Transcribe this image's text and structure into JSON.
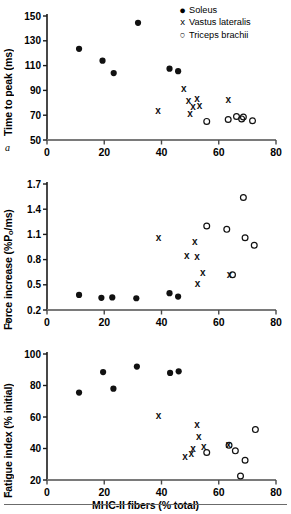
{
  "figure": {
    "xlabel": "MHC-II fibers (% total)",
    "legend": [
      {
        "marker": "filled-circle",
        "symbol": "●",
        "label": "Soleus"
      },
      {
        "marker": "x-cross",
        "symbol": "x",
        "label": "Vastus lateralis"
      },
      {
        "marker": "open-circle",
        "symbol": "○",
        "label": "Triceps brachii"
      }
    ],
    "panel_letters": {
      "a": "a",
      "b": "b",
      "c": "c"
    }
  },
  "chart_data": [
    {
      "type": "scatter",
      "panel": "a",
      "title": "",
      "xlabel": "MHC-II fibers (% total)",
      "ylabel": "Time to peak (ms)",
      "xlim": [
        0,
        80
      ],
      "ylim": [
        50,
        150
      ],
      "xticks": [
        0,
        20,
        40,
        60,
        80
      ],
      "yticks": [
        50,
        70,
        90,
        110,
        130,
        150
      ],
      "grid": false,
      "legend_position": "top-right",
      "series": [
        {
          "name": "Soleus",
          "marker": "filled-circle",
          "points": [
            [
              11.2,
              123.5
            ],
            [
              19.4,
              114.0
            ],
            [
              23.3,
              104.0
            ],
            [
              31.8,
              144.5
            ],
            [
              42.8,
              107.5
            ],
            [
              45.8,
              105.5
            ]
          ]
        },
        {
          "name": "Vastus lateralis",
          "marker": "x-cross",
          "points": [
            [
              38.8,
              74.0
            ],
            [
              47.8,
              91.5
            ],
            [
              49.4,
              81.5
            ],
            [
              51.0,
              77.0
            ],
            [
              50.0,
              71.5
            ],
            [
              52.4,
              83.0
            ],
            [
              53.3,
              77.5
            ],
            [
              63.3,
              82.5
            ]
          ]
        },
        {
          "name": "Triceps brachii",
          "marker": "open-circle",
          "points": [
            [
              55.8,
              65.0
            ],
            [
              63.3,
              66.5
            ],
            [
              66.2,
              69.0
            ],
            [
              68.0,
              67.0
            ],
            [
              68.6,
              68.5
            ],
            [
              71.8,
              65.5
            ]
          ]
        }
      ]
    },
    {
      "type": "scatter",
      "panel": "b",
      "title": "",
      "xlabel": "MHC-II fibers (% total)",
      "ylabel": "Force increase (%Po/ms)",
      "ylabel_parts": {
        "pre": "Force increase (%P",
        "sub": "o",
        "post": "/ms)"
      },
      "xlim": [
        0,
        80
      ],
      "ylim": [
        0.2,
        1.7
      ],
      "xticks": [
        0,
        20,
        40,
        60,
        80
      ],
      "yticks": [
        0.2,
        0.5,
        0.8,
        1.1,
        1.4,
        1.7
      ],
      "grid": false,
      "legend_position": "none",
      "series": [
        {
          "name": "Soleus",
          "marker": "filled-circle",
          "points": [
            [
              11.2,
              0.38
            ],
            [
              19.0,
              0.345
            ],
            [
              22.8,
              0.35
            ],
            [
              31.2,
              0.34
            ],
            [
              42.8,
              0.4
            ],
            [
              45.8,
              0.36
            ]
          ]
        },
        {
          "name": "Vastus lateralis",
          "marker": "x-cross",
          "points": [
            [
              39.0,
              1.06
            ],
            [
              48.8,
              0.85
            ],
            [
              51.6,
              1.02
            ],
            [
              52.4,
              0.83
            ],
            [
              52.6,
              0.51
            ],
            [
              54.4,
              0.64
            ],
            [
              63.8,
              0.62
            ]
          ]
        },
        {
          "name": "Triceps brachii",
          "marker": "open-circle",
          "points": [
            [
              55.8,
              1.2
            ],
            [
              62.8,
              1.16
            ],
            [
              64.8,
              0.62
            ],
            [
              68.6,
              1.54
            ],
            [
              69.2,
              1.06
            ],
            [
              72.4,
              0.97
            ]
          ]
        }
      ]
    },
    {
      "type": "scatter",
      "panel": "c",
      "title": "",
      "xlabel": "MHC-II fibers (% total)",
      "ylabel": "Fatigue index (% initial)",
      "xlim": [
        0,
        80
      ],
      "ylim": [
        20,
        100
      ],
      "xticks": [
        0,
        20,
        40,
        60,
        80
      ],
      "yticks": [
        20,
        40,
        60,
        80,
        100
      ],
      "grid": false,
      "legend_position": "none",
      "series": [
        {
          "name": "Soleus",
          "marker": "filled-circle",
          "points": [
            [
              11.2,
              75.5
            ],
            [
              19.6,
              88.5
            ],
            [
              23.2,
              78.0
            ],
            [
              31.4,
              92.0
            ],
            [
              43.0,
              88.0
            ],
            [
              46.0,
              89.0
            ]
          ]
        },
        {
          "name": "Vastus lateralis",
          "marker": "x-cross",
          "points": [
            [
              39.0,
              61.0
            ],
            [
              48.2,
              35.0
            ],
            [
              50.4,
              36.5
            ],
            [
              51.0,
              40.0
            ],
            [
              52.4,
              55.0
            ],
            [
              53.0,
              47.5
            ],
            [
              54.8,
              41.5
            ],
            [
              63.4,
              42.5
            ]
          ]
        },
        {
          "name": "Triceps brachii",
          "marker": "open-circle",
          "points": [
            [
              55.8,
              37.5
            ],
            [
              63.6,
              42.0
            ],
            [
              65.8,
              38.5
            ],
            [
              67.6,
              22.5
            ],
            [
              69.2,
              32.5
            ],
            [
              72.8,
              52.0
            ]
          ]
        }
      ]
    }
  ]
}
